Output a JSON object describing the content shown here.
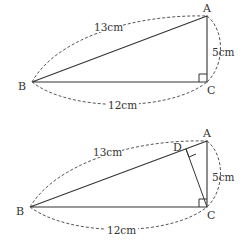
{
  "diagrams": [
    {
      "name": "right-triangle",
      "vertices": {
        "A": "A",
        "B": "B",
        "C": "C"
      },
      "measurements": {
        "AB": "13cm",
        "AC": "5cm",
        "BC": "12cm"
      },
      "right_angle_at": "C"
    },
    {
      "name": "right-triangle-with-altitude",
      "vertices": {
        "A": "A",
        "B": "B",
        "C": "C",
        "D": "D"
      },
      "measurements": {
        "AB": "13cm",
        "AC": "5cm",
        "BC": "12cm"
      },
      "right_angles_at": [
        "C",
        "D"
      ]
    }
  ],
  "colors": {
    "line": "#333333",
    "dashed": "#555555"
  }
}
